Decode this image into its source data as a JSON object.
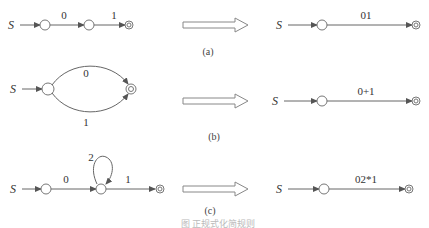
{
  "diagram": {
    "rows": [
      {
        "id": "a",
        "caption": "(a)",
        "before": {
          "start": "S",
          "edges": [
            "0",
            "1"
          ]
        },
        "after": {
          "start": "S",
          "edge": "01"
        }
      },
      {
        "id": "b",
        "caption": "(b)",
        "before": {
          "start": "S",
          "edges": [
            "0",
            "1"
          ],
          "layout": "parallel"
        },
        "after": {
          "start": "S",
          "edge": "0+1"
        }
      },
      {
        "id": "c",
        "caption": "(c)",
        "before": {
          "start": "S",
          "edges": [
            "0",
            "2",
            "1"
          ],
          "self_loop": "2"
        },
        "after": {
          "start": "S",
          "edge": "02*1"
        }
      }
    ],
    "figure_caption": "图 正规式化简规则"
  }
}
